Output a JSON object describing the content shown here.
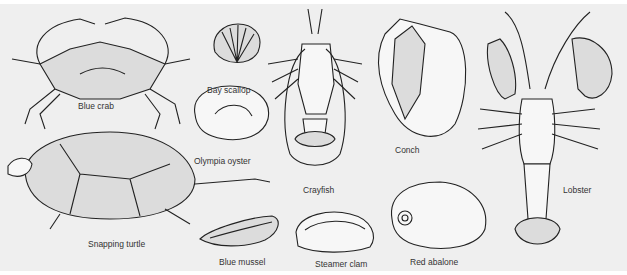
{
  "figure": {
    "background_color": "#efefef",
    "ink_color": "#222222",
    "labels": {
      "blue_crab": "Blue crab",
      "bay_scallop": "Bay scallop",
      "olympia_oyster": "Olympia oyster",
      "crayfish": "Crayfish",
      "conch": "Conch",
      "lobster": "Lobster",
      "snapping_turtle": "Snapping turtle",
      "blue_mussel": "Blue mussel",
      "steamer_clam": "Steamer clam",
      "red_abalone": "Red abalone"
    }
  }
}
